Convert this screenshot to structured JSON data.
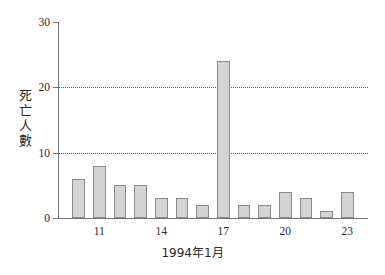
{
  "chart_data": {
    "type": "bar",
    "title": "",
    "subtitle": "",
    "xlabel": "1994年1月",
    "ylabel": "死亡人數",
    "categories": [
      "10",
      "11",
      "12",
      "13",
      "14",
      "15",
      "16",
      "17",
      "18",
      "19",
      "20",
      "21",
      "22",
      "23"
    ],
    "values": [
      6,
      8,
      5,
      5,
      3,
      3,
      2,
      24,
      2,
      2,
      4,
      3,
      1,
      4
    ],
    "series": [
      {
        "name": "死亡人數",
        "values": [
          6,
          8,
          5,
          5,
          3,
          3,
          2,
          24,
          2,
          2,
          4,
          3,
          1,
          4
        ]
      }
    ],
    "ylim": [
      0,
      30
    ],
    "yticks": [
      0,
      10,
      20,
      30
    ],
    "ytick_labels": [
      "0",
      "10",
      "20",
      "30"
    ],
    "xtick_labels": [
      "11",
      "14",
      "17",
      "20",
      "23"
    ],
    "xtick_categories": [
      "11",
      "14",
      "17",
      "20",
      "23"
    ],
    "grid": "horizontal-dotted-at-10-and-20",
    "legend": "none",
    "bar_fill_color": "#d4d4d4",
    "bar_edge_color": "#8a8a8a",
    "axis_color": "#777777",
    "gridline_color": "#5a5a5a",
    "background_color": "#ffffff"
  },
  "axis": {
    "y_title": "死亡人數",
    "x_title": "1994年1月"
  }
}
